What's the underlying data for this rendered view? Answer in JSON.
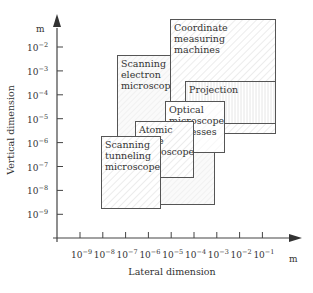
{
  "chart_data": {
    "type": "diagram",
    "title": "",
    "xlabel": "Lateral dimension",
    "ylabel": "Vertical dimension",
    "x_unit": "m",
    "y_unit": "m",
    "x_ticks": [
      "10^-9",
      "10^-8",
      "10^-7",
      "10^-6",
      "10^-5",
      "10^-4",
      "10^-3",
      "10^-2",
      "10^-1"
    ],
    "y_ticks": [
      "10^-2",
      "10^-3",
      "10^-4",
      "10^-5",
      "10^-6",
      "10^-7",
      "10^-8",
      "10^-9"
    ],
    "regions": [
      {
        "name": "Scanning electron microscope",
        "lines": [
          "Scanning",
          "electron",
          "microscope"
        ],
        "x_range": [
          -7.3,
          -4.9
        ],
        "y_range": [
          -8.6,
          -2.3
        ],
        "pattern": "diag-light"
      },
      {
        "name": "Coordinate measuring machines",
        "lines": [
          "Coordinate",
          "measuring",
          "machines"
        ],
        "x_range": [
          -5.1,
          -0.6
        ],
        "y_range": [
          -5.6,
          -1.1
        ],
        "pattern": "diag"
      },
      {
        "name": "Projection",
        "lines": [
          "Projection"
        ],
        "x_range": [
          -4.5,
          -0.6
        ],
        "y_range": [
          -5.2,
          -3.5
        ],
        "pattern": "vertical"
      },
      {
        "name": "Optical microscope processes",
        "lines": [
          "Optical",
          "microscope",
          "processes"
        ],
        "x_range": [
          -5.3,
          -2.7
        ],
        "y_range": [
          -6.2,
          -4.0
        ],
        "pattern": "plain"
      },
      {
        "name": "Atomic force microscope",
        "lines": [
          "Atomic",
          "force",
          "microscope"
        ],
        "x_range": [
          -6.6,
          -4.1
        ],
        "y_range": [
          -7.3,
          -4.9
        ],
        "pattern": "diag"
      },
      {
        "name": "Scanning tunneling microscope",
        "lines": [
          "Scanning",
          "tunneling",
          "microscope"
        ],
        "x_range": [
          -8.0,
          -5.5
        ],
        "y_range": [
          -8.8,
          -5.6
        ],
        "pattern": "diag"
      }
    ]
  },
  "axes": {
    "x_unit_label": "m",
    "y_unit_label": "m",
    "x_title": "Lateral dimension",
    "y_title": "Vertical dimension",
    "x_ticks": [
      {
        "base": "10",
        "exp": "−9"
      },
      {
        "base": "10",
        "exp": "−8"
      },
      {
        "base": "10",
        "exp": "−7"
      },
      {
        "base": "10",
        "exp": "−6"
      },
      {
        "base": "10",
        "exp": "−5"
      },
      {
        "base": "10",
        "exp": "−4"
      },
      {
        "base": "10",
        "exp": "−3"
      },
      {
        "base": "10",
        "exp": "−2"
      },
      {
        "base": "10",
        "exp": "−1"
      }
    ],
    "y_ticks": [
      {
        "base": "10",
        "exp": "−2"
      },
      {
        "base": "10",
        "exp": "−3"
      },
      {
        "base": "10",
        "exp": "−4"
      },
      {
        "base": "10",
        "exp": "−5"
      },
      {
        "base": "10",
        "exp": "−6"
      },
      {
        "base": "10",
        "exp": "−7"
      },
      {
        "base": "10",
        "exp": "−8"
      },
      {
        "base": "10",
        "exp": "−9"
      }
    ]
  },
  "boxes": [
    {
      "id": "sem",
      "lines": [
        "Scanning",
        "electron",
        "microscope"
      ],
      "x": 117,
      "y": 55,
      "w": 97,
      "h": 149,
      "pattern": "diag-light"
    },
    {
      "id": "cmm",
      "lines": [
        "Coordinate",
        "measuring",
        "machines"
      ],
      "x": 170,
      "y": 19,
      "w": 105,
      "h": 114,
      "pattern": "diag"
    },
    {
      "id": "projection",
      "lines": [
        "Projection"
      ],
      "x": 185,
      "y": 81,
      "w": 90,
      "h": 42,
      "pattern": "vertical"
    },
    {
      "id": "optical",
      "lines": [
        "Optical",
        "microscope",
        "processes"
      ],
      "x": 165,
      "y": 101,
      "w": 59,
      "h": 51,
      "pattern": "plain"
    },
    {
      "id": "afm",
      "lines": [
        "Atomic",
        "force",
        "microscope"
      ],
      "x": 135,
      "y": 121,
      "w": 58,
      "h": 56,
      "pattern": "diag"
    },
    {
      "id": "stm",
      "lines": [
        "Scanning",
        "tunneling",
        "microscope"
      ],
      "x": 101,
      "y": 136,
      "w": 59,
      "h": 72,
      "pattern": "diag"
    }
  ],
  "colors": {
    "line": "#555555",
    "text": "#333333",
    "hatch": "#dddddd"
  }
}
